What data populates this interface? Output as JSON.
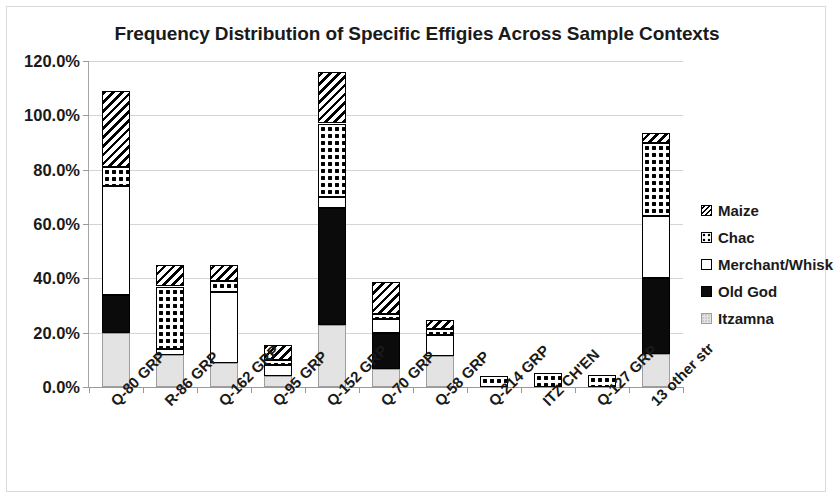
{
  "chart_data": {
    "type": "bar",
    "subtype": "stacked-column",
    "title": "Frequency Distribution of Specific Effigies Across Sample Contexts",
    "xlabel": "",
    "ylabel": "",
    "ylim": [
      0,
      120
    ],
    "ytick_labels": [
      "0.0%",
      "20.0%",
      "40.0%",
      "60.0%",
      "80.0%",
      "100.0%",
      "120.0%"
    ],
    "ytick_values": [
      0,
      20,
      40,
      60,
      80,
      100,
      120
    ],
    "grid": true,
    "legend_position": "right",
    "value_unit": "%",
    "categories": [
      "Q-80 GRP",
      "R-86 GRP",
      "Q-162 GRP",
      "Q-95 GRP",
      "Q-152 GRP",
      "Q-70 GRP",
      "Q-58 GRP",
      "Q-214 GRP",
      "ITZ CH'EN",
      "Q-127 GRP",
      "13 other str"
    ],
    "series": [
      {
        "name": "Itzamna",
        "pattern": "light-gray-speckle",
        "color": "#e3e3e3",
        "values": [
          20.0,
          11.8,
          9.0,
          4.0,
          23.0,
          6.5,
          11.5,
          0.0,
          0.0,
          0.0,
          12.0
        ]
      },
      {
        "name": "Old God",
        "pattern": "solid-black",
        "color": "#0b0b0b",
        "values": [
          14.0,
          0.0,
          0.0,
          0.0,
          43.0,
          13.5,
          0.0,
          0.0,
          0.0,
          0.0,
          28.0
        ]
      },
      {
        "name": "Merchant/Whisk",
        "pattern": "white",
        "color": "#ffffff",
        "values": [
          40.0,
          2.2,
          26.0,
          4.0,
          4.0,
          5.0,
          7.5,
          0.0,
          0.0,
          0.0,
          23.0
        ]
      },
      {
        "name": "Chac",
        "pattern": "dotted-checker",
        "color": "#000000",
        "values": [
          7.0,
          23.0,
          4.0,
          2.0,
          27.0,
          2.0,
          2.5,
          4.0,
          5.0,
          4.5,
          27.0
        ]
      },
      {
        "name": "Maize",
        "pattern": "diagonal-hatch",
        "color": "#000000",
        "values": [
          28.0,
          8.0,
          6.0,
          5.5,
          19.0,
          11.5,
          3.0,
          0.0,
          0.0,
          0.0,
          3.5
        ]
      }
    ],
    "totals": [
      109.0,
      45.0,
      45.0,
      15.5,
      116.0,
      38.5,
      24.5,
      4.0,
      5.0,
      4.5,
      93.5
    ]
  },
  "legend": {
    "items": [
      {
        "label": "Maize",
        "swatch": "maize-swatch-icon"
      },
      {
        "label": "Chac",
        "swatch": "chac-swatch-icon"
      },
      {
        "label": "Merchant/Whisk",
        "swatch": "merchant-swatch-icon"
      },
      {
        "label": "Old God",
        "swatch": "old-god-swatch-icon"
      },
      {
        "label": "Itzamna",
        "swatch": "itzamna-swatch-icon"
      }
    ]
  }
}
